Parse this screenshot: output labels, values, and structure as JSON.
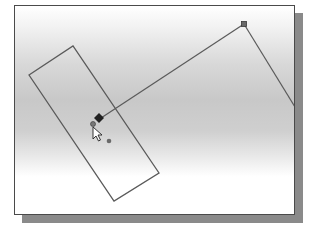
{
  "canvas": {
    "type": "cad-sketch-viewport",
    "frame": {
      "x": 14,
      "y": 5,
      "width": 279,
      "height": 208
    },
    "shadow_color": "#8a8a8a",
    "border_color": "#4a4a4a",
    "line_color": "#5a5a5a"
  },
  "sketch": {
    "rectangle": {
      "points": [
        [
          14,
          69
        ],
        [
          58,
          40
        ],
        [
          144,
          167
        ],
        [
          99,
          195
        ]
      ]
    },
    "line_1": {
      "from": [
        86,
        112
      ],
      "to": [
        229,
        18
      ]
    },
    "line_2": {
      "from": [
        229,
        18
      ],
      "to": [
        280,
        101
      ]
    },
    "endpoint_marker": {
      "x": 229,
      "y": 18
    },
    "center_point": {
      "x": 94,
      "y": 135
    }
  },
  "cursor": {
    "type": "arrow-with-diamond",
    "diamond": {
      "x": 84,
      "y": 112
    },
    "circle": {
      "x": 78,
      "y": 118
    },
    "arrow": {
      "x": 78,
      "y": 121
    }
  }
}
